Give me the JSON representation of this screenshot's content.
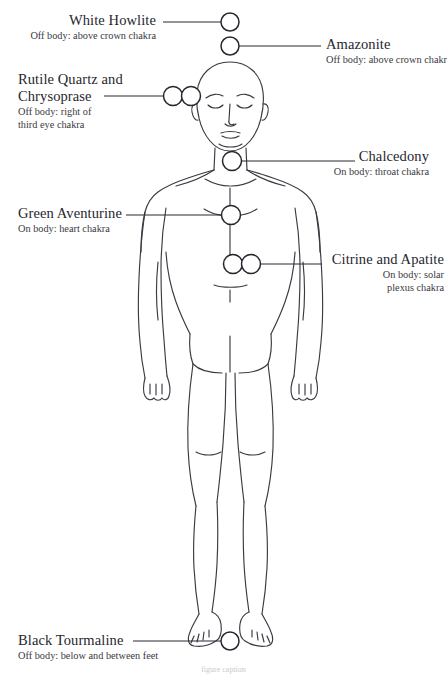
{
  "page": {
    "kind": "crystal-placement-body-diagram",
    "background": "#ffffff",
    "ink": "#2b2b33",
    "width": 447,
    "height": 674
  },
  "labels": {
    "white_howlite": {
      "title": "White Howlite",
      "sub": "Off body: above crown chakra"
    },
    "amazonite": {
      "title": "Amazonite",
      "sub": "Off body: above crown chakra"
    },
    "rutile": {
      "title": "Rutile Quartz and Chrysoprase",
      "title_line1": "Rutile Quartz and",
      "title_line2": "Chrysoprase",
      "sub": "Off body: right of third eye chakra",
      "sub_line1": "Off body: right of",
      "sub_line2": "third eye chakra"
    },
    "chalcedony": {
      "title": "Chalcedony",
      "sub": "On body: throat chakra"
    },
    "green_aventurine": {
      "title": "Green Aventurine",
      "sub": "On body: heart chakra"
    },
    "citrine_apatite": {
      "title": "Citrine and Apatite",
      "sub": "On body: solar plexus chakra",
      "sub_line1": "On body: solar",
      "sub_line2": "plexus chakra"
    },
    "black_tourmaline": {
      "title": "Black Tourmaline",
      "sub": "Off body: below and between feet"
    },
    "bottom_note": {
      "sub": "figure caption"
    }
  },
  "markers": [
    {
      "id": "white-howlite-marker",
      "cx": 230,
      "cy": 22,
      "r": 9,
      "count": 1
    },
    {
      "id": "amazonite-marker",
      "cx": 230,
      "cy": 46,
      "r": 9,
      "count": 1
    },
    {
      "id": "rutile-marker-a",
      "cx": 173,
      "cy": 96,
      "r": 9.5,
      "count": 1
    },
    {
      "id": "rutile-marker-b",
      "cx": 191,
      "cy": 96,
      "r": 9.5,
      "count": 1
    },
    {
      "id": "chalcedony-marker",
      "cx": 232,
      "cy": 161,
      "r": 9.5,
      "count": 1
    },
    {
      "id": "green-aventurine-marker",
      "cx": 231,
      "cy": 215,
      "r": 9.5,
      "count": 1
    },
    {
      "id": "citrine-marker-a",
      "cx": 233,
      "cy": 264,
      "r": 9.5,
      "count": 1
    },
    {
      "id": "apatite-marker-b",
      "cx": 251,
      "cy": 264,
      "r": 9.5,
      "count": 1
    },
    {
      "id": "black-tourmaline-marker",
      "cx": 230,
      "cy": 641,
      "r": 9,
      "count": 1
    }
  ],
  "leader_lines": [
    {
      "id": "leader-white-howlite",
      "x1": 163,
      "y1": 22,
      "x2": 221,
      "y2": 22
    },
    {
      "id": "leader-amazonite",
      "x1": 239,
      "y1": 46,
      "x2": 321,
      "y2": 46
    },
    {
      "id": "leader-rutile",
      "x1": 104,
      "y1": 96,
      "x2": 163,
      "y2": 96
    },
    {
      "id": "leader-chalcedony",
      "x1": 242,
      "y1": 161,
      "x2": 355,
      "y2": 161
    },
    {
      "id": "leader-green-aventurine",
      "x1": 126,
      "y1": 215,
      "x2": 221,
      "y2": 215
    },
    {
      "id": "leader-citrine",
      "x1": 261,
      "y1": 264,
      "x2": 322,
      "y2": 264
    },
    {
      "id": "leader-black-tourmaline",
      "x1": 133,
      "y1": 641,
      "x2": 221,
      "y2": 641
    }
  ]
}
